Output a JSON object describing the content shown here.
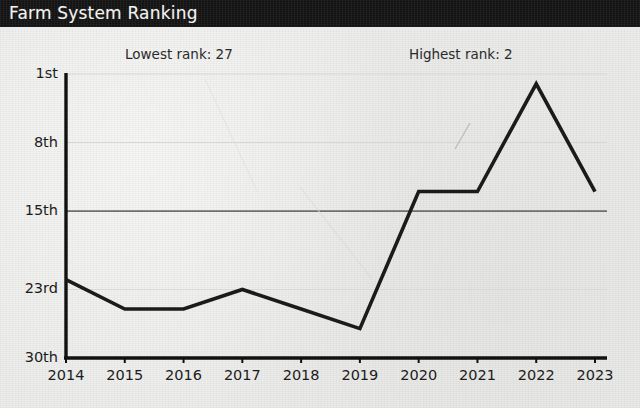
{
  "window": {
    "title": "Farm System Ranking"
  },
  "annotations": {
    "lowest": "Lowest rank: 27",
    "highest": "Highest rank: 2"
  },
  "colors": {
    "title_bar": "#141414",
    "title_text": "#f2f2f0",
    "background": "#ececea",
    "line": "#1b1b1b",
    "axis": "#111111",
    "gridline_major": "#6e6e6e",
    "gridline_minor": "#d8d8d6",
    "tick_text": "#1c1c1c"
  },
  "chart_data": {
    "type": "line",
    "title": "Farm System Ranking",
    "xlabel": "",
    "ylabel": "",
    "x": [
      2014,
      2015,
      2016,
      2017,
      2018,
      2019,
      2020,
      2021,
      2022,
      2023
    ],
    "categories": [
      "2014",
      "2015",
      "2016",
      "2017",
      "2018",
      "2019",
      "2020",
      "2021",
      "2022",
      "2023"
    ],
    "values": [
      22,
      25,
      25,
      23,
      25,
      27,
      13,
      13,
      2,
      13
    ],
    "series": [
      {
        "name": "Farm System Ranking",
        "values": [
          22,
          25,
          25,
          23,
          25,
          27,
          13,
          13,
          2,
          13
        ]
      }
    ],
    "y_inverted": true,
    "ylim": [
      30,
      1
    ],
    "yticks": [
      1,
      8,
      15,
      23,
      30
    ],
    "ytick_labels": [
      "1st",
      "8th",
      "15th",
      "23rd",
      "30th"
    ],
    "xtick_labels": [
      "2014",
      "2015",
      "2016",
      "2017",
      "2018",
      "2019",
      "2020",
      "2021",
      "2022",
      "2023"
    ],
    "grid": true,
    "emphasized_gridline": 15,
    "legend": "none",
    "annotations": [
      {
        "text": "Lowest rank: 27",
        "value": 27,
        "at_x": 2019
      },
      {
        "text": "Highest rank: 2",
        "value": 2,
        "at_x": 2022
      }
    ]
  }
}
